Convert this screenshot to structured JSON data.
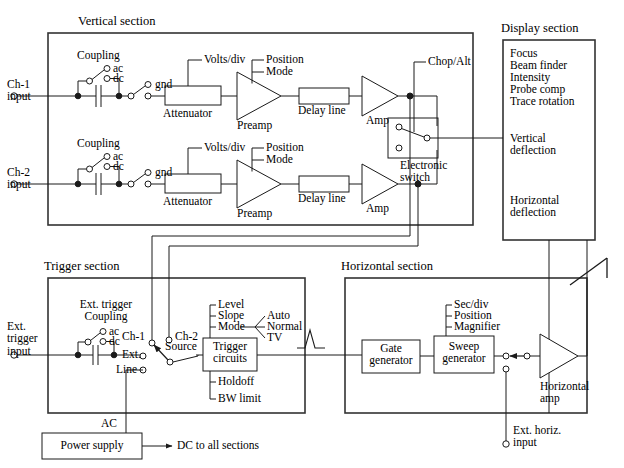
{
  "diagram": {
    "sections": {
      "vertical": {
        "title": "Vertical section"
      },
      "display": {
        "title": "Display section"
      },
      "trigger": {
        "title": "Trigger section"
      },
      "horizontal": {
        "title": "Horizontal section"
      }
    },
    "vertical_section": {
      "ch1": {
        "input_label": "Ch-1\ninput",
        "coupling_label": "Coupling",
        "ac": "ac",
        "dc": "dc",
        "gnd": "gnd",
        "attenuator": "Attenuator",
        "volts_div": "Volts/div",
        "preamp": "Preamp",
        "position": "Position",
        "mode": "Mode",
        "delay_line": "Delay line",
        "amp": "Amp"
      },
      "ch2": {
        "input_label": "Ch-2\ninput",
        "coupling_label": "Coupling",
        "ac": "ac",
        "dc": "dc",
        "gnd": "gnd",
        "attenuator": "Attenuator",
        "volts_div": "Volts/div",
        "preamp": "Preamp",
        "position": "Position",
        "mode": "Mode",
        "delay_line": "Delay line",
        "amp": "Amp"
      },
      "electronic_switch": "Electronic\nswitch",
      "chop_alt": "Chop/Alt"
    },
    "display_section": {
      "controls": [
        "Focus",
        "Beam finder",
        "Intensity",
        "Probe comp",
        "Trace rotation"
      ],
      "vertical_deflection": "Vertical\ndeflection",
      "horizontal_deflection": "Horizontal\ndeflection"
    },
    "trigger_section": {
      "ext_input_label": "Ext.\ntrigger\ninput",
      "ext_trigger_coupling": "Ext. trigger\nCoupling",
      "ac": "ac",
      "dc": "dc",
      "source_options": [
        "Ch-1",
        "Ch-2",
        "Ext.",
        "Line"
      ],
      "source_label": "Source",
      "trigger_circuits": "Trigger\ncircuits",
      "top_controls": [
        "Level",
        "Slope",
        "Mode"
      ],
      "mode_options": [
        "Auto",
        "Normal",
        "TV"
      ],
      "bottom_controls": [
        "Holdoff",
        "BW limit"
      ]
    },
    "horizontal_section": {
      "gate_generator": "Gate\ngenerator",
      "sweep_generator": "Sweep\ngenerator",
      "sweep_controls": [
        "Sec/div",
        "Position",
        "Magnifier"
      ],
      "horizontal_amp": "Horizontal\namp",
      "ext_horiz_input": "Ext. horiz.\ninput"
    },
    "power": {
      "power_supply": "Power supply",
      "ac_label": "AC",
      "dc_label": "DC to all sections"
    },
    "colors": {
      "line": "#1a1a1a",
      "box": "#333333",
      "background": "#ffffff"
    }
  }
}
